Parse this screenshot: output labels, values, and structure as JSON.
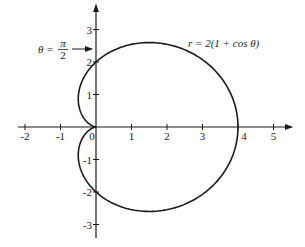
{
  "chart_data": {
    "type": "polar-curve",
    "title": "",
    "equation_label": "r = 2(1 + cos θ)",
    "annotation": {
      "text_theta": "θ =",
      "fraction_num": "π",
      "fraction_den": "2",
      "points_to": [
        0,
        2
      ]
    },
    "curve": {
      "name": "cardioid",
      "a": 2,
      "formula": "r = 2(1 + cos(theta))",
      "theta_range": [
        0,
        6.2832
      ]
    },
    "x_ticks": [
      "-2",
      "-1",
      "0",
      "1",
      "2",
      "3",
      "4",
      "5"
    ],
    "y_ticks_positive": [
      "1",
      "2",
      "3"
    ],
    "y_ticks_negative": [
      "-1",
      "-2",
      "-3"
    ],
    "xlim": [
      -2.2,
      5.5
    ],
    "ylim": [
      -3.3,
      3.8
    ],
    "key_points": [
      [
        4,
        0
      ],
      [
        0,
        2
      ],
      [
        0,
        -2
      ],
      [
        0,
        0
      ]
    ],
    "grid": false,
    "legend": "none"
  },
  "colors": {
    "curve": "#1a1a1a",
    "axes": "#1a1a1a",
    "background": "#ffffff"
  }
}
